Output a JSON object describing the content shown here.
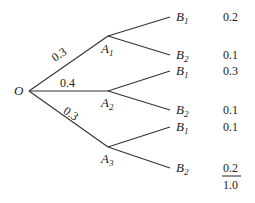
{
  "diagram": {
    "type": "probability-tree",
    "root": {
      "label": "O"
    },
    "branches": [
      {
        "node": "A",
        "sub": "1",
        "prob": "0.3",
        "children": [
          {
            "node": "B",
            "sub": "1",
            "joint": "0.2"
          },
          {
            "node": "B",
            "sub": "2",
            "joint": "0.1"
          }
        ]
      },
      {
        "node": "A",
        "sub": "2",
        "prob": "0.4",
        "children": [
          {
            "node": "B",
            "sub": "1",
            "joint": "0.3"
          },
          {
            "node": "B",
            "sub": "2",
            "joint": "0.1"
          }
        ]
      },
      {
        "node": "A",
        "sub": "3",
        "prob": "0.3",
        "children": [
          {
            "node": "B",
            "sub": "1",
            "joint": "0.1"
          },
          {
            "node": "B",
            "sub": "2",
            "joint": "0.2"
          }
        ]
      }
    ],
    "total": "1.0"
  }
}
